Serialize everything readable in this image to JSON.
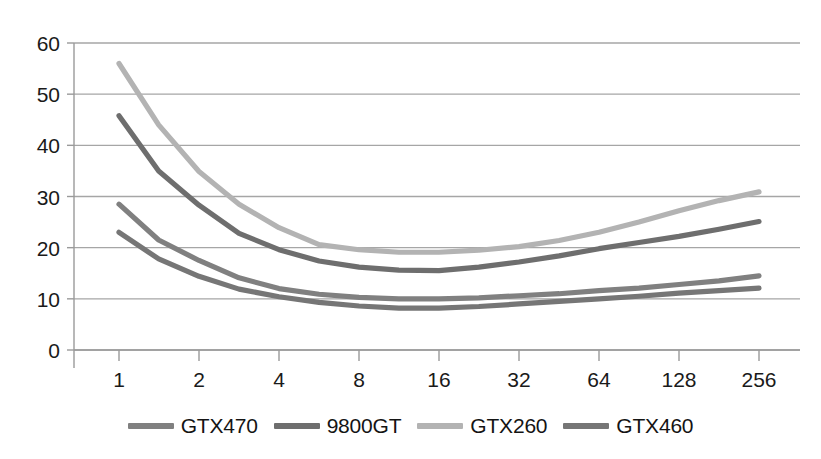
{
  "chart_data": {
    "type": "line",
    "title": "",
    "xlabel": "",
    "ylabel": "",
    "x": [
      1,
      2,
      4,
      8,
      16,
      32,
      64,
      128,
      256
    ],
    "x_tick_labels": [
      "1",
      "2",
      "4",
      "8",
      "16",
      "32",
      "64",
      "128",
      "256"
    ],
    "x_scale": "log2",
    "y_tick_labels": [
      "0",
      "10",
      "20",
      "30",
      "40",
      "50",
      "60"
    ],
    "y_ticks": [
      0,
      10,
      20,
      30,
      40,
      50,
      60
    ],
    "ylim": [
      0,
      60
    ],
    "grid": "horizontal",
    "legend_position": "bottom",
    "series": [
      {
        "name": "GTX470",
        "color": "#808080",
        "values": [
          28.5,
          17.5,
          12.0,
          10.3,
          10.0,
          10.6,
          11.6,
          12.8,
          14.5
        ]
      },
      {
        "name": "9800GT",
        "color": "#6e6e6e",
        "values": [
          45.8,
          28.3,
          19.6,
          16.2,
          15.5,
          17.2,
          19.8,
          22.2,
          25.1
        ]
      },
      {
        "name": "GTX260",
        "color": "#b3b3b3",
        "values": [
          56.0,
          34.9,
          23.9,
          19.6,
          19.1,
          20.2,
          23.0,
          27.2,
          30.9
        ]
      },
      {
        "name": "GTX460",
        "color": "#767676",
        "values": [
          23.0,
          14.4,
          10.4,
          8.6,
          8.2,
          9.0,
          10.0,
          11.1,
          12.1
        ]
      }
    ],
    "extra_vertices": {
      "note": "intermediate half-step points between log2 ticks",
      "x_half": [
        1.41,
        2.83,
        5.66,
        11.3,
        22.6,
        45.3,
        90.5,
        181
      ],
      "GTX470": [
        21.5,
        14.1,
        10.9,
        10.0,
        10.2,
        11.0,
        12.1,
        13.5
      ],
      "9800GT": [
        35.0,
        22.8,
        17.4,
        15.6,
        16.2,
        18.4,
        21.0,
        23.6
      ],
      "GTX260": [
        44.0,
        28.5,
        20.6,
        19.1,
        19.5,
        21.4,
        25.0,
        29.2
      ],
      "GTX460": [
        17.8,
        11.9,
        9.3,
        8.2,
        8.5,
        9.5,
        10.5,
        11.6
      ]
    },
    "axis_color": "#9a9a9a",
    "grid_color": "#a6a6a6",
    "background": "#ffffff"
  },
  "legend": {
    "items": [
      {
        "label": "GTX470",
        "color": "#808080"
      },
      {
        "label": "9800GT",
        "color": "#6e6e6e"
      },
      {
        "label": "GTX260",
        "color": "#b3b3b3"
      },
      {
        "label": "GTX460",
        "color": "#767676"
      }
    ]
  }
}
